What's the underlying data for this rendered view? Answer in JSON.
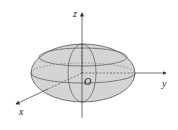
{
  "diagram": {
    "axes": {
      "x_label": "x",
      "y_label": "y",
      "z_label": "z",
      "origin_label": "O"
    },
    "colors": {
      "fill": "#d4d4d4",
      "stroke": "#555555",
      "axis": "#333333"
    }
  }
}
